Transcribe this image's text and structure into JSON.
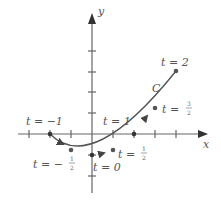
{
  "diagram": {
    "type": "parametric-curve",
    "curve_name": "C",
    "parametrization": {
      "x": "2t",
      "y": "t^2 - 1",
      "t_range": [
        -1,
        2
      ]
    },
    "axes": {
      "x_label": "x",
      "y_label": "y"
    },
    "colors": {
      "axis": "#555555",
      "curve": "#555555",
      "text": "#555555"
    },
    "points": [
      {
        "t_text": "t = −1",
        "t_num": "",
        "t_den": "",
        "x": -2,
        "y": 0
      },
      {
        "t_text": "t = −",
        "t_num": "1",
        "t_den": "2",
        "x": -1,
        "y": -0.75
      },
      {
        "t_text": "t = 0",
        "t_num": "",
        "t_den": "",
        "x": 0,
        "y": -1
      },
      {
        "t_text": "t = ",
        "t_num": "1",
        "t_den": "2",
        "x": 1,
        "y": -0.75
      },
      {
        "t_text": "t = 1",
        "t_num": "",
        "t_den": "",
        "x": 2,
        "y": 0
      },
      {
        "t_text": "t = ",
        "t_num": "3",
        "t_den": "2",
        "x": 3,
        "y": 1.25
      },
      {
        "t_text": "t = 2",
        "t_num": "",
        "t_den": "",
        "x": 4,
        "y": 3
      }
    ]
  },
  "labels": {
    "x_axis": "x",
    "y_axis": "y",
    "curve": "C",
    "t_neg1": "t = −1",
    "t_neg_half_prefix": "t = −",
    "t_neg_half_num": "1",
    "t_neg_half_den": "2",
    "t_0": "t = 0",
    "t_half_prefix": "t = ",
    "t_half_num": "1",
    "t_half_den": "2",
    "t_1": "t = 1",
    "t_3half_prefix": "t = ",
    "t_3half_num": "3",
    "t_3half_den": "2",
    "t_2": "t = 2"
  }
}
